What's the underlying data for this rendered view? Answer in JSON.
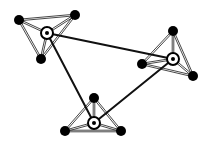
{
  "diagram": {
    "type": "graph",
    "colors": {
      "background": "#ffffff",
      "edge": "#111111",
      "intra_edge": "#333333",
      "node_fill": "#000000",
      "hub_ring": "#000000",
      "hub_inner": "#ffffff"
    },
    "clusters": [
      {
        "id": "top-left",
        "hub": {
          "id": "H1",
          "x": 47,
          "y": 33
        },
        "outer": [
          {
            "id": "A",
            "x": 19,
            "y": 20
          },
          {
            "id": "B",
            "x": 75,
            "y": 15
          },
          {
            "id": "C",
            "x": 41,
            "y": 59
          }
        ]
      },
      {
        "id": "right",
        "hub": {
          "id": "H2",
          "x": 173,
          "y": 59
        },
        "outer": [
          {
            "id": "D",
            "x": 173,
            "y": 31
          },
          {
            "id": "E",
            "x": 142,
            "y": 64
          },
          {
            "id": "F",
            "x": 193,
            "y": 76
          }
        ]
      },
      {
        "id": "bottom",
        "hub": {
          "id": "H3",
          "x": 94,
          "y": 123
        },
        "outer": [
          {
            "id": "G",
            "x": 94,
            "y": 98
          },
          {
            "id": "I",
            "x": 65,
            "y": 131
          },
          {
            "id": "J",
            "x": 121,
            "y": 131
          }
        ]
      }
    ],
    "hub_edges": [
      {
        "from": "H1",
        "to": "H2"
      },
      {
        "from": "H1",
        "to": "H3"
      },
      {
        "from": "H3",
        "to": "H2"
      }
    ]
  }
}
